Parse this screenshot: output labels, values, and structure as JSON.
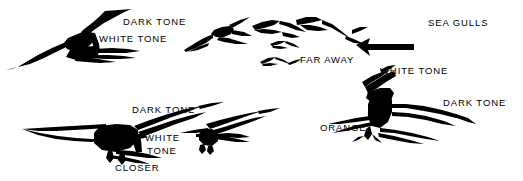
{
  "figure": {
    "type": "line-art illustration",
    "background_color": "#ffffff",
    "ink_color": "#000000",
    "width": 523,
    "height": 181
  },
  "labels": [
    {
      "id": "dark-tone-upper-left",
      "text": "DARK TONE",
      "x": 123,
      "y": 17
    },
    {
      "id": "white-tone-upper-left",
      "text": "WHITE TONE",
      "x": 99,
      "y": 34
    },
    {
      "id": "sea-gulls",
      "text": "SEA GULLS",
      "x": 428,
      "y": 18
    },
    {
      "id": "far-away",
      "text": "FAR AWAY",
      "x": 300,
      "y": 55
    },
    {
      "id": "white-tone-right",
      "text": "WHITE TONE",
      "x": 380,
      "y": 66
    },
    {
      "id": "dark-tone-lower-left",
      "text": "DARK TONE",
      "x": 132,
      "y": 105
    },
    {
      "id": "dark-tone-right",
      "text": "DARK TONE",
      "x": 443,
      "y": 98
    },
    {
      "id": "orange",
      "text": "ORANGE",
      "x": 320,
      "y": 123
    },
    {
      "id": "white-center",
      "text": "WHITE",
      "x": 145,
      "y": 133
    },
    {
      "id": "tone-center",
      "text": "TONE",
      "x": 147,
      "y": 146
    },
    {
      "id": "closer",
      "text": "CLOSER",
      "x": 115,
      "y": 163
    }
  ],
  "birds": [
    {
      "id": "gull-large-upper-left",
      "description": "large gull gliding, wings spread, upper left"
    },
    {
      "id": "gull-mid-upper-center-left",
      "description": "mid-size gull, upper center-left"
    },
    {
      "id": "gull-small-center-top",
      "description": "small gull, center top"
    },
    {
      "id": "gull-small-center-right-top",
      "description": "small gull, center right top"
    },
    {
      "id": "gull-tiny-far-away-a",
      "description": "tiny distant gull above FAR AWAY label"
    },
    {
      "id": "gull-tiny-far-away-b",
      "description": "tiny distant gull below, far away"
    },
    {
      "id": "gull-arrow-silhouette",
      "description": "solid arrow-like gull shape, center right"
    },
    {
      "id": "gull-large-right-foreground",
      "description": "large foreground gull, right side, legs down"
    },
    {
      "id": "gull-large-bottom-left-closer",
      "description": "large closest gull, bottom left, landing pose"
    },
    {
      "id": "gull-mid-bottom-center",
      "description": "mid gull, bottom center right"
    }
  ]
}
